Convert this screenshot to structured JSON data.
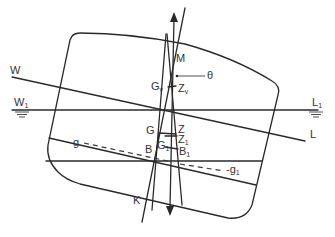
{
  "diagram": {
    "type": "ship-stability-inclined-hull",
    "labels": {
      "W": "W",
      "W1": "W",
      "W1_sub": "1",
      "L": "L",
      "L1": "L",
      "L1_sub": "1",
      "M": "M",
      "theta": "θ",
      "Gv": "G",
      "Gv_sub": "v",
      "Zv": "Z",
      "Zv_sub": "v",
      "G": "G",
      "Z": "Z",
      "Z1": "Z",
      "Z1_sub": "1",
      "G1": "G",
      "G1_sub": "1",
      "B": "B",
      "B1": "B",
      "B1_sub": "1",
      "g": "g",
      "g1": "-g",
      "g1_sub": "1",
      "K": "K"
    },
    "colors": {
      "line": "#2a2a2a",
      "text": "#333333",
      "background": "#ffffff"
    }
  }
}
